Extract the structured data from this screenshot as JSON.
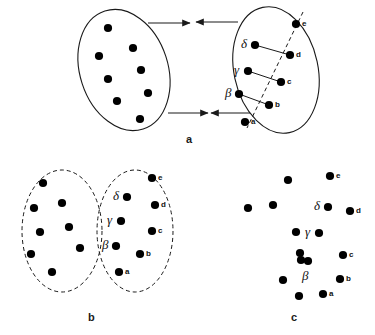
{
  "figure": {
    "background_color": "#ffffff",
    "stroke_color": "#1a1a1a",
    "dot_color": "#000000"
  },
  "panels": [
    {
      "id": "a",
      "label": "a",
      "label_pos": {
        "x": 186,
        "y": 133
      },
      "description": "Two separate ellipses approaching, arrows pointing inward",
      "ellipses": [
        {
          "name": "left-ellipse",
          "cx": 124,
          "cy": 70,
          "rx": 44,
          "ry": 62,
          "rotate": -18,
          "stroke": "solid",
          "dots": [
            {
              "x": 108,
              "y": 28
            },
            {
              "x": 133,
              "y": 48
            },
            {
              "x": 99,
              "y": 56
            },
            {
              "x": 141,
              "y": 70
            },
            {
              "x": 108,
              "y": 79
            },
            {
              "x": 148,
              "y": 93
            },
            {
              "x": 117,
              "y": 101
            },
            {
              "x": 140,
              "y": 119
            }
          ]
        },
        {
          "name": "right-ellipse",
          "cx": 276,
          "cy": 70,
          "rx": 42,
          "ry": 64,
          "rotate": -12,
          "stroke": "solid",
          "dashed_axis": {
            "x1": 303,
            "y1": 12,
            "x2": 247,
            "y2": 128
          },
          "dots": [
            {
              "x": 296,
              "y": 24,
              "label": "e",
              "label_side": "right"
            },
            {
              "x": 255,
              "y": 45,
              "label": "δ",
              "label_side": "left",
              "greek": true
            },
            {
              "x": 290,
              "y": 55,
              "label": "d",
              "label_side": "right"
            },
            {
              "x": 248,
              "y": 71,
              "label": "γ",
              "label_side": "left",
              "greek": true
            },
            {
              "x": 281,
              "y": 82,
              "label": "c",
              "label_side": "right"
            },
            {
              "x": 239,
              "y": 94,
              "label": "β",
              "label_side": "left",
              "greek": true
            },
            {
              "x": 269,
              "y": 105,
              "label": "b",
              "label_side": "right"
            },
            {
              "x": 245,
              "y": 122,
              "label": "a",
              "label_side": "right"
            }
          ],
          "connectors": [
            {
              "x1": 255,
              "y1": 45,
              "x2": 290,
              "y2": 55
            },
            {
              "x1": 248,
              "y1": 71,
              "x2": 281,
              "y2": 82
            },
            {
              "x1": 239,
              "y1": 94,
              "x2": 269,
              "y2": 105
            }
          ]
        }
      ],
      "arrows": [
        {
          "name": "arrow-top-left",
          "x1": 148,
          "y1": 23,
          "x2": 190,
          "y2": 23,
          "dir": "right"
        },
        {
          "name": "arrow-top-right",
          "x1": 238,
          "y1": 22,
          "x2": 196,
          "y2": 22,
          "dir": "left"
        },
        {
          "name": "arrow-bottom-left",
          "x1": 168,
          "y1": 113,
          "x2": 208,
          "y2": 113,
          "dir": "right"
        },
        {
          "name": "arrow-bottom-right",
          "x1": 250,
          "y1": 113,
          "x2": 211,
          "y2": 113,
          "dir": "left"
        }
      ]
    },
    {
      "id": "b",
      "label": "b",
      "label_pos": {
        "x": 88,
        "y": 311
      },
      "description": "Two dashed ellipses in contact",
      "ellipses": [
        {
          "name": "left-ellipse",
          "cx": 62,
          "cy": 231,
          "rx": 40,
          "ry": 61,
          "rotate": 0,
          "stroke": "dashed",
          "dots": [
            {
              "x": 43,
              "y": 183
            },
            {
              "x": 62,
              "y": 203
            },
            {
              "x": 34,
              "y": 208
            },
            {
              "x": 69,
              "y": 227
            },
            {
              "x": 40,
              "y": 232
            },
            {
              "x": 80,
              "y": 248
            },
            {
              "x": 31,
              "y": 254
            },
            {
              "x": 52,
              "y": 272
            }
          ]
        },
        {
          "name": "right-ellipse",
          "cx": 135,
          "cy": 231,
          "rx": 38,
          "ry": 61,
          "rotate": 0,
          "stroke": "dashed",
          "dots": [
            {
              "x": 152,
              "y": 178,
              "label": "e",
              "label_side": "right"
            },
            {
              "x": 127,
              "y": 197,
              "label": "δ",
              "label_side": "left",
              "greek": true
            },
            {
              "x": 155,
              "y": 205,
              "label": "d",
              "label_side": "right"
            },
            {
              "x": 121,
              "y": 221,
              "label": "γ",
              "label_side": "left",
              "greek": true
            },
            {
              "x": 152,
              "y": 231,
              "label": "c",
              "label_side": "right"
            },
            {
              "x": 116,
              "y": 246,
              "label": "β",
              "label_side": "left",
              "greek": true
            },
            {
              "x": 140,
              "y": 254,
              "label": "b",
              "label_side": "right"
            },
            {
              "x": 119,
              "y": 272,
              "label": "a",
              "label_side": "right"
            }
          ]
        }
      ],
      "arrows": []
    },
    {
      "id": "c",
      "label": "c",
      "label_pos": {
        "x": 291,
        "y": 311
      },
      "description": "Single merged cluster, no boundary, beta marks fused dot pair",
      "ellipses": [
        {
          "name": "merged-cluster",
          "cx": 290,
          "cy": 231,
          "rx": 0,
          "ry": 0,
          "rotate": 0,
          "stroke": "none",
          "dots": [
            {
              "x": 288,
              "y": 180
            },
            {
              "x": 330,
              "y": 176,
              "label": "e",
              "label_side": "right"
            },
            {
              "x": 248,
              "y": 208
            },
            {
              "x": 273,
              "y": 205
            },
            {
              "x": 328,
              "y": 207,
              "label": "δ",
              "label_side": "left",
              "greek": true
            },
            {
              "x": 350,
              "y": 211,
              "label": "d",
              "label_side": "right"
            },
            {
              "x": 296,
              "y": 232
            },
            {
              "x": 319,
              "y": 233,
              "label": "γ",
              "label_side": "left",
              "greek": true
            },
            {
              "x": 300,
              "y": 253
            },
            {
              "x": 343,
              "y": 255,
              "label": "c",
              "label_side": "right"
            },
            {
              "x": 308,
              "y": 261,
              "fused": true
            },
            {
              "x": 283,
              "y": 280
            },
            {
              "x": 340,
              "y": 279,
              "label": "b",
              "label_side": "right"
            },
            {
              "x": 299,
              "y": 296
            },
            {
              "x": 323,
              "y": 294,
              "label": "a",
              "label_side": "right"
            }
          ],
          "greek_only": [
            {
              "x": 308,
              "y": 277,
              "label": "β"
            }
          ]
        }
      ],
      "arrows": []
    }
  ]
}
